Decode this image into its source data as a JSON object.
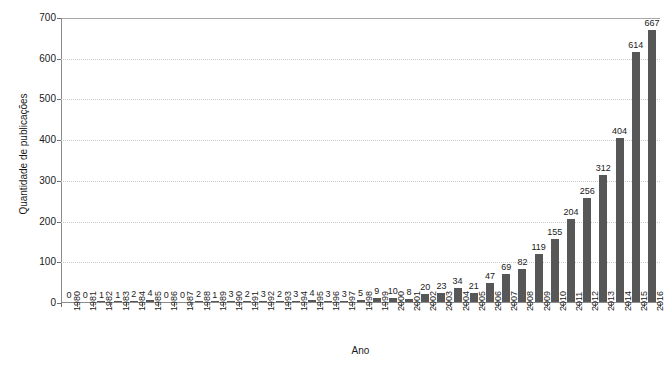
{
  "chart_data": {
    "type": "bar",
    "title": "",
    "xlabel": "Ano",
    "ylabel": "Quantidade de publicações",
    "ylim": [
      0,
      700
    ],
    "ytick_values": [
      0,
      100,
      200,
      300,
      400,
      500,
      600,
      700
    ],
    "ytick_labels": [
      "0",
      "100",
      "200",
      "300",
      "400",
      "500",
      "600",
      "700"
    ],
    "grid": true,
    "grid_axis": "y",
    "legend": false,
    "bar_color": "#575757",
    "data_labels": true,
    "categories": [
      "1980",
      "1981",
      "1982",
      "1983",
      "1984",
      "1985",
      "1986",
      "1987",
      "1988",
      "1989",
      "1990",
      "1991",
      "1992",
      "1993",
      "1994",
      "1995",
      "1996",
      "1997",
      "1998",
      "1999",
      "2000",
      "2001",
      "2002",
      "2003",
      "2004",
      "2005",
      "2006",
      "2007",
      "2008",
      "2009",
      "2010",
      "2011",
      "2012",
      "2013",
      "2014",
      "2015",
      "2016"
    ],
    "values": [
      0,
      0,
      1,
      1,
      2,
      4,
      0,
      0,
      2,
      1,
      3,
      2,
      3,
      2,
      3,
      4,
      3,
      3,
      5,
      9,
      10,
      8,
      20,
      23,
      34,
      21,
      47,
      69,
      82,
      119,
      155,
      204,
      256,
      312,
      404,
      614,
      667
    ]
  },
  "caption": {
    "partial_text": ""
  }
}
